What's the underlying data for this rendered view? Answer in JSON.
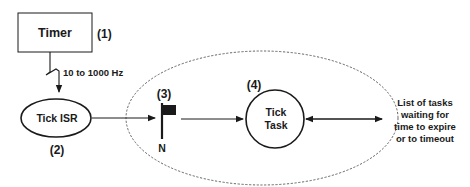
{
  "diagram": {
    "timer": {
      "label": "Timer",
      "number": "(1)"
    },
    "frequency": {
      "label": "10 to 1000 Hz"
    },
    "tick_isr": {
      "label": "Tick ISR",
      "number": "(2)"
    },
    "semaphore": {
      "number": "(3)",
      "count_label": "N"
    },
    "tick_task": {
      "line1": "Tick",
      "line2": "Task",
      "number": "(4)"
    },
    "task_list": {
      "line1": "List of tasks",
      "line2": "waiting for",
      "line3": "time to expire",
      "line4": "or to timeout"
    },
    "colors": {
      "stroke": "#1a1a1a",
      "dashed": "#555555",
      "background": "#ffffff"
    }
  }
}
